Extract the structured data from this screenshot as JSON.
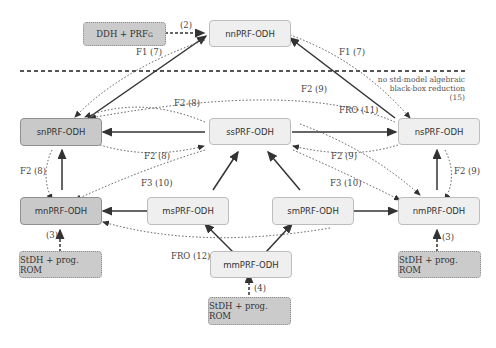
{
  "nodes": {
    "ddh_prf": {
      "label": "DDH + PRF",
      "sub": "G"
    },
    "nn": {
      "label": "nnPRF-ODH"
    },
    "sn": {
      "label": "snPRF-ODH"
    },
    "ss": {
      "label": "ssPRF-ODH"
    },
    "ns": {
      "label": "nsPRF-ODH"
    },
    "mn": {
      "label": "mnPRF-ODH"
    },
    "ms": {
      "label": "msPRF-ODH"
    },
    "sm": {
      "label": "smPRF-ODH"
    },
    "nm": {
      "label": "nmPRF-ODH"
    },
    "mm": {
      "label": "mmPRF-ODH"
    },
    "stdh_left": {
      "label": "StDH + prog. ROM"
    },
    "stdh_right": {
      "label": "StDH + prog. ROM"
    },
    "stdh_bottom": {
      "label": "StDH + prog. ROM"
    }
  },
  "labels": {
    "e2": "(2)",
    "f1_left": "F1 (7)",
    "f1_right": "F1 (7)",
    "f2_8_top": "F2 (8)",
    "f2_8_mid": "F2 (8)",
    "f2_8_left": "F2 (8)",
    "f2_9_top": "F2 (9)",
    "f2_9_mid": "F2 (9)",
    "f2_9_right": "F2 (9)",
    "fro_11": "FRO (11)",
    "fro_12": "FRO (12)",
    "f3_10_left": "F3 (10)",
    "f3_10_right": "F3 (10)",
    "e3_left": "(3)",
    "e3_right": "(3)",
    "e4": "(4)"
  },
  "separator_note": {
    "line1": "no std-model algebraic",
    "line2": "black-box reduction",
    "line3": "(15)"
  },
  "colors": {
    "dark_node": "#c9c9c9",
    "light_node": "#efefef",
    "assumption_node": "#cbcbcb",
    "edge": "#333333"
  }
}
